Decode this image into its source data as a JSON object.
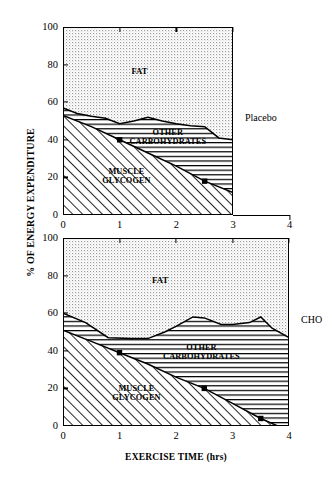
{
  "axes": {
    "ylabel": "% OF ENERGY EXPENDITURE",
    "xlabel": "EXERCISE TIME (hrs)",
    "yticks": [
      "0",
      "20",
      "40",
      "60",
      "80",
      "100"
    ],
    "xticks": [
      "0",
      "1",
      "2",
      "3",
      "4"
    ]
  },
  "panels": {
    "top": {
      "side_label": "Placebo",
      "labels": {
        "fat": "FAT",
        "carbs_line1": "OTHER",
        "carbs_line2": "CARBOHYDRATES",
        "glycogen_line1": "MUSCLE",
        "glycogen_line2": "GLYCOGEN"
      }
    },
    "bottom": {
      "side_label": "CHO",
      "labels": {
        "fat": "FAT",
        "carbs_line1": "OTHER",
        "carbs_line2": "CARBOHYDRATES",
        "glycogen_line1": "MUSCLE",
        "glycogen_line2": "GLYCOGEN"
      }
    }
  },
  "chart_data": {
    "type": "area",
    "title": "",
    "xlabel": "EXERCISE TIME (hrs)",
    "ylabel": "% OF ENERGY EXPENDITURE",
    "xlim": [
      0,
      4
    ],
    "ylim": [
      0,
      100
    ],
    "ytick_values": [
      0,
      20,
      40,
      60,
      80,
      100
    ],
    "xtick_values": [
      0,
      1,
      2,
      3,
      4
    ],
    "grid": false,
    "stacking": "cumulative-to-100",
    "layer_order_bottom_to_top": [
      "MUSCLE GLYCOGEN",
      "OTHER CARBOHYDRATES",
      "FAT"
    ],
    "panels": [
      {
        "name": "Placebo",
        "side_label": "Placebo",
        "x_data_range": [
          0,
          3
        ],
        "series": [
          {
            "name": "MUSCLE GLYCOGEN",
            "fill": "diagonal-hatch",
            "comment": "cumulative upper boundary of glycogen layer",
            "x": [
              0,
              0.5,
              1.0,
              1.5,
              2.0,
              2.5,
              3.0
            ],
            "values": [
              53,
              47,
              40,
              33,
              26,
              18,
              12
            ]
          },
          {
            "name": "OTHER CARBOHYDRATES",
            "fill": "horizontal-lines",
            "comment": "cumulative upper boundary of glycogen+carbohydrates",
            "x": [
              0,
              0.25,
              0.5,
              0.75,
              1.0,
              1.25,
              1.5,
              1.75,
              2.0,
              2.25,
              2.5,
              2.75,
              3.0
            ],
            "values": [
              57,
              54,
              52.5,
              51.5,
              48.5,
              50,
              52,
              50,
              48.5,
              47.5,
              47,
              41,
              40
            ]
          },
          {
            "name": "FAT",
            "fill": "stipple",
            "comment": "remainder up to 100%",
            "x": [
              0,
              3
            ],
            "values": [
              100,
              100
            ]
          }
        ],
        "markers": [
          {
            "x": 1.0,
            "y": 40,
            "shape": "filled-square",
            "series": "MUSCLE GLYCOGEN"
          },
          {
            "x": 2.5,
            "y": 18,
            "shape": "filled-square",
            "series": "MUSCLE GLYCOGEN"
          }
        ]
      },
      {
        "name": "CHO",
        "side_label": "CHO",
        "x_data_range": [
          0,
          4
        ],
        "series": [
          {
            "name": "MUSCLE GLYCOGEN",
            "fill": "diagonal-hatch",
            "comment": "cumulative upper boundary of glycogen layer",
            "x": [
              0,
              0.5,
              1.0,
              1.5,
              2.0,
              2.5,
              3.0,
              3.5,
              3.8,
              4.0
            ],
            "values": [
              51,
              45,
              39,
              33,
              26,
              20,
              12,
              4,
              0,
              0
            ]
          },
          {
            "name": "OTHER CARBOHYDRATES",
            "fill": "horizontal-lines",
            "comment": "cumulative upper boundary of glycogen+carbohydrates",
            "x": [
              0,
              0.4,
              0.8,
              1.2,
              1.5,
              1.8,
              2.0,
              2.3,
              2.5,
              2.8,
              3.0,
              3.3,
              3.5,
              3.7,
              4.0
            ],
            "values": [
              60,
              55,
              47,
              46.5,
              46.5,
              50,
              53,
              58,
              57.5,
              54,
              54,
              55,
              58,
              52,
              47
            ]
          },
          {
            "name": "FAT",
            "fill": "stipple",
            "comment": "remainder up to 100%",
            "x": [
              0,
              4
            ],
            "values": [
              100,
              100
            ]
          }
        ],
        "markers": [
          {
            "x": 1.0,
            "y": 39,
            "shape": "filled-square",
            "series": "MUSCLE GLYCOGEN"
          },
          {
            "x": 2.5,
            "y": 20,
            "shape": "filled-square",
            "series": "MUSCLE GLYCOGEN"
          },
          {
            "x": 3.5,
            "y": 4,
            "shape": "filled-square",
            "series": "MUSCLE GLYCOGEN"
          }
        ]
      }
    ]
  }
}
